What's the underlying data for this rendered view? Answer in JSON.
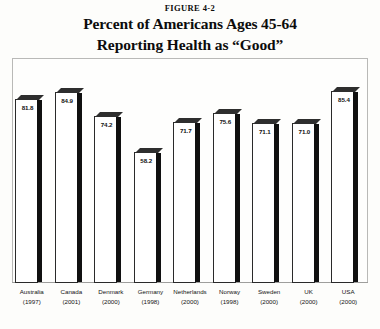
{
  "figure_number": "FIGURE 4-2",
  "title_line_1": "Percent of Americans Ages 45-64",
  "title_line_2": "Reporting Health as “Good”",
  "chart_data": {
    "type": "bar",
    "title": "Percent of Americans Ages 45-64 Reporting Health as “Good”",
    "subtitle": "FIGURE 4-2",
    "xlabel": "",
    "ylabel": "",
    "ylim": [
      0,
      100
    ],
    "grid": false,
    "legend": "none",
    "categories": [
      "Australia",
      "Canada",
      "Denmark",
      "Germany",
      "Netherlands",
      "Norway",
      "Sweden",
      "UK",
      "USA"
    ],
    "category_years": [
      "(1997)",
      "(2001)",
      "(2000)",
      "(1998)",
      "(2000)",
      "(1998)",
      "(2000)",
      "(2000)",
      "(2000)"
    ],
    "values": [
      81.8,
      84.9,
      74.2,
      58.2,
      71.7,
      75.6,
      71.1,
      71.0,
      85.4
    ],
    "value_labels": [
      "81.8",
      "84.9",
      "74.2",
      "58.2",
      "71.7",
      "75.6",
      "71.1",
      "71.0",
      "85.4"
    ],
    "colors": {
      "bar_face": "#ffffff",
      "bar_outline": "#2a2a2a",
      "bar_side": "#101010",
      "bar_top": "#2e2e2e",
      "background": "#fdfdfb",
      "frame": "#b9b9b7",
      "text": "#0c0c0c"
    }
  }
}
